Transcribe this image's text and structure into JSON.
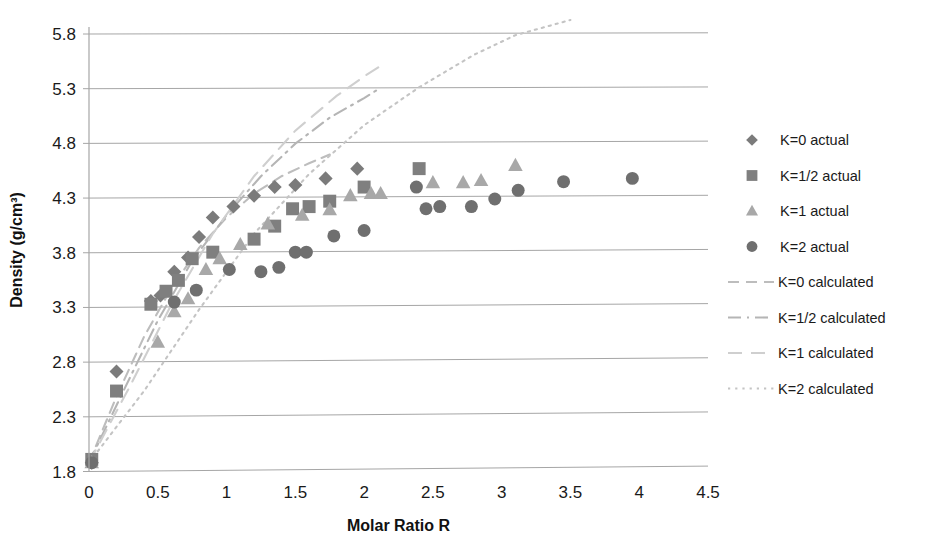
{
  "chart_data": {
    "type": "scatter",
    "title": "",
    "xlabel": "Molar Ratio R",
    "ylabel": "Density (g/cm³)",
    "xlim": [
      0,
      4.5
    ],
    "ylim": [
      1.8,
      5.8
    ],
    "xticks": [
      "0",
      "0.5",
      "1",
      "1.5",
      "2",
      "2.5",
      "3",
      "3.5",
      "4",
      "4.5"
    ],
    "yticks": [
      "1.8",
      "2.3",
      "2.8",
      "3.3",
      "3.8",
      "4.3",
      "4.8",
      "5.3",
      "5.8"
    ],
    "grid": true,
    "legend_position": "right",
    "series": [
      {
        "name": "K=0 actual",
        "marker": "diamond",
        "color": "#7b7b7b",
        "points": [
          [
            0.02,
            1.84
          ],
          [
            0.2,
            2.68
          ],
          [
            0.45,
            3.33
          ],
          [
            0.52,
            3.38
          ],
          [
            0.62,
            3.6
          ],
          [
            0.72,
            3.73
          ],
          [
            0.8,
            3.92
          ],
          [
            0.9,
            4.1
          ],
          [
            1.05,
            4.2
          ],
          [
            1.2,
            4.3
          ],
          [
            1.35,
            4.38
          ],
          [
            1.5,
            4.4
          ],
          [
            1.72,
            4.46
          ],
          [
            1.95,
            4.55
          ]
        ]
      },
      {
        "name": "K=1/2 actual",
        "marker": "square",
        "color": "#7f7f7f",
        "points": [
          [
            0.02,
            1.87
          ],
          [
            0.2,
            2.5
          ],
          [
            0.45,
            3.3
          ],
          [
            0.56,
            3.42
          ],
          [
            0.65,
            3.52
          ],
          [
            0.75,
            3.72
          ],
          [
            0.9,
            3.78
          ],
          [
            1.2,
            3.9
          ],
          [
            1.35,
            4.02
          ],
          [
            1.48,
            4.18
          ],
          [
            1.6,
            4.2
          ],
          [
            1.75,
            4.25
          ],
          [
            2.0,
            4.38
          ],
          [
            2.4,
            4.55
          ]
        ]
      },
      {
        "name": "K=1 actual",
        "marker": "triangle",
        "color": "#a8a8a8",
        "points": [
          [
            0.02,
            1.84
          ],
          [
            0.5,
            2.95
          ],
          [
            0.62,
            3.23
          ],
          [
            0.72,
            3.35
          ],
          [
            0.85,
            3.62
          ],
          [
            0.95,
            3.72
          ],
          [
            1.1,
            3.85
          ],
          [
            1.3,
            4.04
          ],
          [
            1.55,
            4.12
          ],
          [
            1.75,
            4.17
          ],
          [
            1.9,
            4.3
          ],
          [
            2.05,
            4.32
          ],
          [
            2.12,
            4.32
          ],
          [
            2.5,
            4.42
          ],
          [
            2.72,
            4.42
          ],
          [
            2.85,
            4.44
          ],
          [
            3.1,
            4.58
          ]
        ]
      },
      {
        "name": "K=2 actual",
        "marker": "circle",
        "color": "#6f6f6f",
        "points": [
          [
            0.02,
            1.84
          ],
          [
            0.62,
            3.32
          ],
          [
            0.78,
            3.43
          ],
          [
            1.02,
            3.62
          ],
          [
            1.25,
            3.6
          ],
          [
            1.38,
            3.64
          ],
          [
            1.5,
            3.78
          ],
          [
            1.58,
            3.78
          ],
          [
            1.78,
            3.93
          ],
          [
            2.0,
            3.98
          ],
          [
            2.38,
            4.38
          ],
          [
            2.45,
            4.18
          ],
          [
            2.55,
            4.2
          ],
          [
            2.78,
            4.2
          ],
          [
            2.95,
            4.27
          ],
          [
            3.12,
            4.35
          ],
          [
            3.45,
            4.43
          ],
          [
            3.95,
            4.46
          ]
        ]
      }
    ],
    "curves": [
      {
        "name": "K=0 calculated",
        "style": "dashed",
        "color": "#bdbdbd",
        "points": [
          [
            0.0,
            1.84
          ],
          [
            0.2,
            2.45
          ],
          [
            0.4,
            3.0
          ],
          [
            0.6,
            3.45
          ],
          [
            0.8,
            3.82
          ],
          [
            1.0,
            4.1
          ],
          [
            1.2,
            4.32
          ],
          [
            1.4,
            4.48
          ],
          [
            1.6,
            4.6
          ],
          [
            1.75,
            4.68
          ]
        ]
      },
      {
        "name": "K=1/2 calculated",
        "style": "dash-dot",
        "color": "#b5b5b5",
        "points": [
          [
            0.0,
            1.84
          ],
          [
            0.25,
            2.5
          ],
          [
            0.5,
            3.15
          ],
          [
            0.75,
            3.7
          ],
          [
            1.0,
            4.12
          ],
          [
            1.25,
            4.48
          ],
          [
            1.5,
            4.78
          ],
          [
            1.75,
            5.02
          ],
          [
            2.0,
            5.2
          ],
          [
            2.1,
            5.28
          ]
        ]
      },
      {
        "name": "K=1 calculated",
        "style": "long-dash",
        "color": "#cfcfcf",
        "points": [
          [
            0.0,
            1.84
          ],
          [
            0.3,
            2.55
          ],
          [
            0.6,
            3.3
          ],
          [
            0.9,
            3.95
          ],
          [
            1.2,
            4.48
          ],
          [
            1.5,
            4.9
          ],
          [
            1.8,
            5.22
          ],
          [
            2.0,
            5.4
          ],
          [
            2.15,
            5.52
          ]
        ]
      },
      {
        "name": "K=2 calculated",
        "style": "dotted",
        "color": "#c4c4c4",
        "points": [
          [
            0.0,
            1.84
          ],
          [
            0.4,
            2.5
          ],
          [
            0.8,
            3.25
          ],
          [
            1.2,
            3.95
          ],
          [
            1.6,
            4.5
          ],
          [
            2.0,
            4.95
          ],
          [
            2.4,
            5.3
          ],
          [
            2.8,
            5.6
          ],
          [
            3.1,
            5.78
          ],
          [
            3.5,
            5.92
          ]
        ]
      }
    ],
    "legend": [
      {
        "label": "K=0 actual",
        "type": "marker",
        "marker": "diamond",
        "color": "#7b7b7b"
      },
      {
        "label": "K=1/2 actual",
        "type": "marker",
        "marker": "square",
        "color": "#7f7f7f"
      },
      {
        "label": "K=1 actual",
        "type": "marker",
        "marker": "triangle",
        "color": "#a8a8a8"
      },
      {
        "label": "K=2 actual",
        "type": "marker",
        "marker": "circle",
        "color": "#6f6f6f"
      },
      {
        "label": "K=0 calculated",
        "type": "line",
        "style": "dashed",
        "color": "#bdbdbd"
      },
      {
        "label": "K=1/2 calculated",
        "type": "line",
        "style": "dash-dot",
        "color": "#b5b5b5"
      },
      {
        "label": "K=1 calculated",
        "type": "line",
        "style": "long-dash",
        "color": "#cfcfcf"
      },
      {
        "label": "K=2 calculated",
        "type": "line",
        "style": "dotted",
        "color": "#c4c4c4"
      }
    ]
  }
}
